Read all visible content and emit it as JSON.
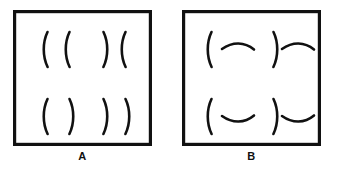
{
  "figure": {
    "background_color": "#ffffff",
    "ink_color": "#111111",
    "panel_count": 2
  },
  "panels": [
    {
      "id": "A",
      "label": "A",
      "description": "Square outline containing four quadrant groups of vertical curved brackets",
      "border_width_px": 3,
      "quadrants": [
        {
          "position": "top-left",
          "marks": [
            "(",
            "("
          ]
        },
        {
          "position": "top-right",
          "marks": [
            ")",
            "("
          ]
        },
        {
          "position": "bottom-left",
          "marks": [
            "(",
            ")"
          ]
        },
        {
          "position": "bottom-right",
          "marks": [
            ")",
            ")"
          ]
        }
      ]
    },
    {
      "id": "B",
      "label": "B",
      "description": "Square outline containing four quadrant groups pairing a vertical bracket with a horizontal arc",
      "border_width_px": 3,
      "quadrants": [
        {
          "position": "top-left",
          "marks": [
            "(",
            "arc-down"
          ]
        },
        {
          "position": "top-right",
          "marks": [
            ")",
            "arc-down"
          ]
        },
        {
          "position": "bottom-left",
          "marks": [
            "(",
            "arc-up"
          ]
        },
        {
          "position": "bottom-right",
          "marks": [
            ")",
            "arc-up"
          ]
        }
      ]
    }
  ],
  "labels": {
    "panel_a": "A",
    "panel_b": "B"
  }
}
